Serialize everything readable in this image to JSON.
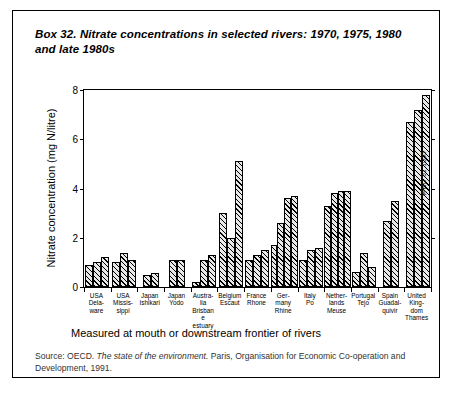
{
  "box": {
    "title": "Box 32. Nitrate concentrations in selected rivers: 1970, 1975, 1980 and late 1980s",
    "measured_note": "Measured at mouth or downstream frontier of rivers",
    "source_prefix": "Source: OECD. ",
    "source_italic": "The state of the environment.",
    "source_suffix": " Paris, Organisation for Economic Co-operation and Development, 1991.",
    "watermark": "WHO 91 1055"
  },
  "chart_data": {
    "type": "bar",
    "title": "Box 32. Nitrate concentrations in selected rivers: 1970, 1975, 1980 and late 1980s",
    "xlabel": "",
    "ylabel": "Nitrate concentration (mg N/litre)",
    "ylim": [
      0,
      8
    ],
    "yticks": [
      0,
      2,
      4,
      6,
      8
    ],
    "ytick_labels": [
      "0",
      "2",
      "4",
      "6",
      "8"
    ],
    "grid": false,
    "legend": "none",
    "series_note": "Bars within each group are successive years: 1970, 1975, 1980 and late 1980s",
    "categories": [
      "USA Dela-ware",
      "USA Missis-sippi",
      "Japan Ishikari",
      "Japan Yodo",
      "Austra-lia Brisbane estuary",
      "Belgium Escaut",
      "France Rhone",
      "Ger-many Rhine",
      "Italy Po",
      "Nether-lands Meuse",
      "Portugal Tejo",
      "Spain Guadal-quivir",
      "United King-dom Thames"
    ],
    "groups": [
      {
        "label": "USA Delaware",
        "values": [
          0.9,
          1.0,
          1.2
        ]
      },
      {
        "label": "USA Mississippi",
        "values": [
          1.0,
          1.4,
          1.1
        ]
      },
      {
        "label": "Japan Ishikari",
        "values": [
          0.5,
          0.55
        ]
      },
      {
        "label": "Japan Yodo",
        "values": [
          1.1,
          1.1
        ]
      },
      {
        "label": "Australia Brisbane estuary",
        "values": [
          0.2,
          1.1,
          1.3
        ]
      },
      {
        "label": "Belgium Escaut",
        "values": [
          3.0,
          2.0,
          5.1
        ]
      },
      {
        "label": "France Rhone",
        "values": [
          1.1,
          1.3,
          1.5
        ]
      },
      {
        "label": "Germany Rhine",
        "values": [
          1.7,
          2.6,
          3.6,
          3.7
        ]
      },
      {
        "label": "Italy Po",
        "values": [
          1.1,
          1.5,
          1.6
        ]
      },
      {
        "label": "Netherlands Meuse",
        "values": [
          3.3,
          3.8,
          3.9,
          3.9
        ]
      },
      {
        "label": "Portugal Tejo",
        "values": [
          0.6,
          1.4,
          0.8
        ]
      },
      {
        "label": "Spain Guadalquivir",
        "values": [
          2.7,
          3.5
        ]
      },
      {
        "label": "United Kingdom Thames",
        "values": [
          6.7,
          7.2,
          7.8
        ]
      }
    ]
  }
}
